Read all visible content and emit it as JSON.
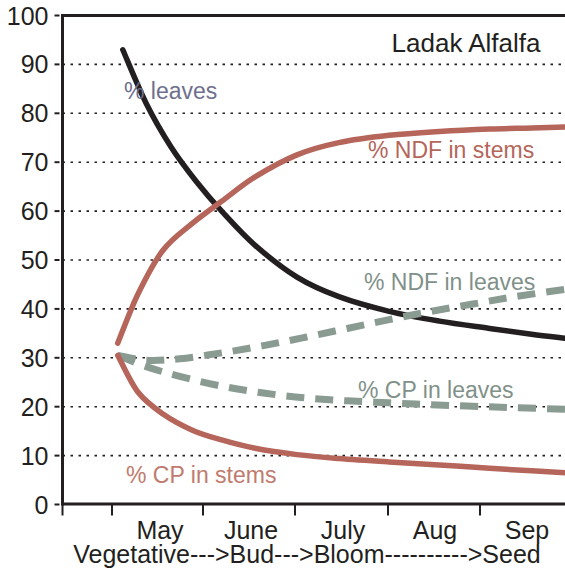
{
  "chart_data": {
    "type": "line",
    "title": "Ladak Alfalfa",
    "xlabel": "Vegetative--->Bud--->Bloom---------->Seed",
    "ylabel": "",
    "xlim": [
      0,
      6
    ],
    "ylim": [
      0,
      100
    ],
    "grid": true,
    "legend_position": "inline-annotations",
    "x_tick_labels": [
      "May",
      "June",
      "July",
      "Aug",
      "Sep"
    ],
    "y_tick_labels": [
      "0",
      "10",
      "20",
      "30",
      "40",
      "50",
      "60",
      "70",
      "80",
      "90",
      "100"
    ],
    "y_ticks": [
      0,
      10,
      20,
      30,
      40,
      50,
      60,
      70,
      80,
      90,
      100
    ],
    "series": [
      {
        "name": "% leaves",
        "color": "#231f20",
        "label_color": "#6f6f8e",
        "style": "solid",
        "x": [
          0.72,
          1.0,
          1.3,
          1.6,
          1.9,
          2.3,
          2.8,
          3.3,
          3.9,
          4.5,
          5.1,
          5.6,
          6.0
        ],
        "values": [
          93,
          82,
          73,
          66,
          60,
          53,
          46.5,
          42.5,
          39.5,
          37.5,
          36,
          34.8,
          34
        ]
      },
      {
        "name": "% NDF in stems",
        "color": "#b5655a",
        "label_color": "#b5655a",
        "style": "solid",
        "x": [
          0.66,
          0.9,
          1.2,
          1.55,
          1.9,
          2.3,
          2.8,
          3.3,
          3.9,
          4.5,
          5.1,
          5.6,
          6.0
        ],
        "values": [
          33,
          43,
          52,
          57.5,
          62,
          67,
          71.5,
          74,
          75.5,
          76.3,
          76.8,
          77,
          77.2
        ]
      },
      {
        "name": "% NDF in leaves",
        "color": "#8a9c92",
        "label_color": "#7f9189",
        "style": "dashed",
        "x": [
          0.66,
          1.0,
          1.4,
          1.9,
          2.4,
          2.9,
          3.4,
          3.9,
          4.4,
          4.9,
          5.4,
          6.0
        ],
        "values": [
          30.5,
          29.5,
          29.8,
          31,
          32.5,
          34.2,
          36,
          37.8,
          39.5,
          41,
          42.5,
          44
        ]
      },
      {
        "name": "% CP in leaves",
        "color": "#8a9c92",
        "label_color": "#7f9189",
        "style": "dashed",
        "x": [
          0.66,
          1.0,
          1.4,
          1.9,
          2.4,
          2.9,
          3.4,
          3.9,
          4.4,
          4.9,
          5.4,
          6.0
        ],
        "values": [
          30.5,
          28.2,
          26.2,
          24.2,
          22.8,
          21.8,
          21.2,
          20.8,
          20.4,
          20.1,
          19.8,
          19.5
        ]
      },
      {
        "name": "% CP in stems",
        "color": "#b5655a",
        "label_color": "#c07b6e",
        "style": "solid",
        "x": [
          0.66,
          0.9,
          1.2,
          1.55,
          1.9,
          2.3,
          2.8,
          3.3,
          3.9,
          4.5,
          5.1,
          5.6,
          6.0
        ],
        "values": [
          30.5,
          23,
          18.5,
          15.2,
          13.2,
          11.5,
          10.2,
          9.4,
          8.7,
          8.1,
          7.4,
          6.9,
          6.5
        ]
      }
    ],
    "annotations": [
      {
        "text": "% leaves",
        "x_px": 124,
        "y_px": 99,
        "color": "#6f6f8e"
      },
      {
        "text": "% NDF in stems",
        "x_px": 368,
        "y_px": 158,
        "color": "#b5655a"
      },
      {
        "text": "% NDF in leaves",
        "x_px": 364,
        "y_px": 290,
        "color": "#7f9189"
      },
      {
        "text": "% CP in leaves",
        "x_px": 358,
        "y_px": 398,
        "color": "#7f9189"
      },
      {
        "text": "% CP in stems",
        "x_px": 126,
        "y_px": 483,
        "color": "#c07b6e"
      }
    ]
  }
}
